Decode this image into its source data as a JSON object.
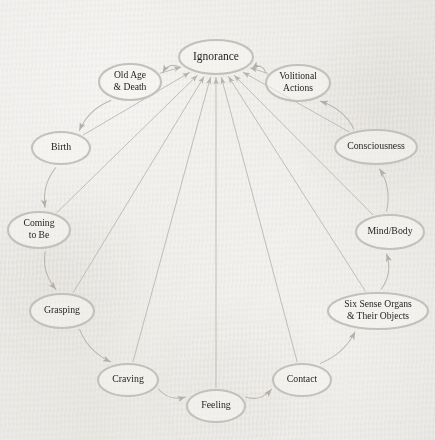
{
  "diagram": {
    "type": "cycle-diagram",
    "background_color": "#eceae6",
    "node_fill": "#f6f5f2",
    "node_stroke": "#c3c1bb",
    "edge_color": "#b9b6af",
    "text_color": "#231f1c",
    "hub": "ignorance",
    "nodes": [
      {
        "id": "ignorance",
        "label": "Ignorance",
        "lines": [
          "Ignorance"
        ],
        "cx": 216,
        "cy": 57,
        "rx": 37,
        "ry": 17,
        "font": 11.5
      },
      {
        "id": "volitional",
        "label": "Volitional Actions",
        "lines": [
          "Volitional",
          "Actions"
        ],
        "cx": 298,
        "cy": 83,
        "rx": 32,
        "ry": 18,
        "font": 9.6
      },
      {
        "id": "consciousness",
        "label": "Consciousness",
        "lines": [
          "Consciousness"
        ],
        "cx": 376,
        "cy": 147,
        "rx": 41,
        "ry": 17,
        "font": 9.8
      },
      {
        "id": "mindbody",
        "label": "Mind/Body",
        "lines": [
          "Mind/Body"
        ],
        "cx": 390,
        "cy": 232,
        "rx": 34,
        "ry": 17,
        "font": 9.8
      },
      {
        "id": "sixsense",
        "label": "Six Sense Organs & Their Objects",
        "lines": [
          "Six Sense Organs",
          "& Their Objects"
        ],
        "cx": 378,
        "cy": 311,
        "rx": 50,
        "ry": 18,
        "font": 9.6
      },
      {
        "id": "contact",
        "label": "Contact",
        "lines": [
          "Contact"
        ],
        "cx": 302,
        "cy": 380,
        "rx": 29,
        "ry": 16,
        "font": 9.8
      },
      {
        "id": "feeling",
        "label": "Feeling",
        "lines": [
          "Feeling"
        ],
        "cx": 216,
        "cy": 406,
        "rx": 29,
        "ry": 16,
        "font": 9.8
      },
      {
        "id": "craving",
        "label": "Craving",
        "lines": [
          "Craving"
        ],
        "cx": 128,
        "cy": 380,
        "rx": 30,
        "ry": 16,
        "font": 9.8
      },
      {
        "id": "grasping",
        "label": "Grasping",
        "lines": [
          "Grasping"
        ],
        "cx": 62,
        "cy": 311,
        "rx": 32,
        "ry": 17,
        "font": 9.8
      },
      {
        "id": "comingtobe",
        "label": "Coming to Be",
        "lines": [
          "Coming",
          "to Be"
        ],
        "cx": 39,
        "cy": 230,
        "rx": 31,
        "ry": 18,
        "font": 9.6
      },
      {
        "id": "birth",
        "label": "Birth",
        "lines": [
          "Birth"
        ],
        "cx": 61,
        "cy": 148,
        "rx": 29,
        "ry": 16,
        "font": 9.8
      },
      {
        "id": "oldage",
        "label": "Old Age & Death",
        "lines": [
          "Old Age",
          "& Death"
        ],
        "cx": 130,
        "cy": 82,
        "rx": 31,
        "ry": 18,
        "font": 9.6
      }
    ],
    "ring_edges": [
      {
        "from": "oldage",
        "to": "birth",
        "label": "Old Age & Death to Birth"
      },
      {
        "from": "birth",
        "to": "comingtobe",
        "label": "Birth to Coming to Be"
      },
      {
        "from": "comingtobe",
        "to": "grasping",
        "label": "Coming to Be to Grasping"
      },
      {
        "from": "grasping",
        "to": "craving",
        "label": "Grasping to Craving"
      },
      {
        "from": "craving",
        "to": "feeling",
        "label": "Craving to Feeling"
      },
      {
        "from": "feeling",
        "to": "contact",
        "label": "Feeling to Contact"
      },
      {
        "from": "contact",
        "to": "sixsense",
        "label": "Contact to Six Sense Organs"
      },
      {
        "from": "sixsense",
        "to": "mindbody",
        "label": "Six Sense Organs to Mind/Body"
      },
      {
        "from": "mindbody",
        "to": "consciousness",
        "label": "Mind/Body to Consciousness"
      },
      {
        "from": "consciousness",
        "to": "volitional",
        "label": "Consciousness to Volitional Actions"
      },
      {
        "from": "volitional",
        "to": "ignorance",
        "label": "Volitional Actions to Ignorance"
      },
      {
        "from": "ignorance",
        "to": "oldage",
        "label": "Ignorance to Old Age & Death"
      }
    ],
    "spoke_edges": [
      {
        "from": "volitional",
        "to": "ignorance"
      },
      {
        "from": "consciousness",
        "to": "ignorance"
      },
      {
        "from": "mindbody",
        "to": "ignorance"
      },
      {
        "from": "sixsense",
        "to": "ignorance"
      },
      {
        "from": "contact",
        "to": "ignorance"
      },
      {
        "from": "feeling",
        "to": "ignorance"
      },
      {
        "from": "craving",
        "to": "ignorance"
      },
      {
        "from": "grasping",
        "to": "ignorance"
      },
      {
        "from": "comingtobe",
        "to": "ignorance"
      },
      {
        "from": "birth",
        "to": "ignorance"
      },
      {
        "from": "oldage",
        "to": "ignorance"
      }
    ]
  }
}
